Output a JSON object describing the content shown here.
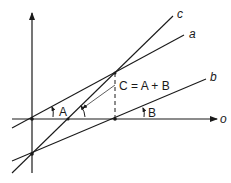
{
  "diagram": {
    "axis_label": "o",
    "lines": [
      {
        "name": "a",
        "label": "a"
      },
      {
        "name": "b",
        "label": "b"
      },
      {
        "name": "c",
        "label": "c"
      }
    ],
    "angles": [
      {
        "name": "A",
        "label": "A"
      },
      {
        "name": "B",
        "label": "B"
      }
    ],
    "equation": "C = A + B",
    "colors": {
      "stroke": "#1a1a1a",
      "background": "#ffffff"
    }
  }
}
